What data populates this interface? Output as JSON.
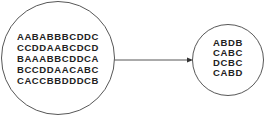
{
  "diagram": {
    "source_pool": {
      "lines": [
        "AABABBBCDDC",
        "CCDDAABCDCD",
        "BAAABBCDDCA",
        "BCCDDAACABC",
        "CACCBBDDDCB"
      ]
    },
    "target_pool": {
      "lines": [
        "ABDB",
        "CABC",
        "DCBC",
        "CABD"
      ]
    },
    "arrow": {
      "from": "source_pool",
      "to": "target_pool"
    },
    "colors": {
      "stroke": "#444444",
      "text": "#222222",
      "background": "#ffffff"
    }
  }
}
